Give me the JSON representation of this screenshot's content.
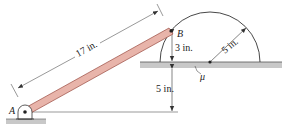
{
  "diagram": {
    "points": {
      "A": "A",
      "B": "B"
    },
    "dimensions": {
      "rod_length": "17 in.",
      "b_above_floor": "3 in.",
      "floor_above_a": "5 in.",
      "radius": "5 in."
    },
    "friction_label": "μ",
    "colors": {
      "rod_fill": "#e8b4aa",
      "rod_edge": "#9a4a40",
      "floor_fill": "#c8c8c8",
      "line": "#333333"
    }
  }
}
